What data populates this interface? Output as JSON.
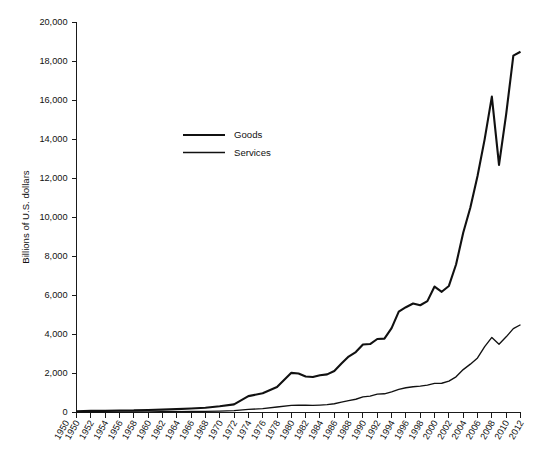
{
  "chart_data": {
    "type": "line",
    "title": "",
    "subtitle": "",
    "xlabel": "",
    "ylabel": "Billions of U.S. dollars",
    "ylim": [
      0,
      20000
    ],
    "xlim": [
      1950,
      2012
    ],
    "grid": false,
    "legend_position": "upper-left-inside",
    "y_ticks": [
      0,
      2000,
      4000,
      6000,
      8000,
      10000,
      12000,
      14000,
      16000,
      18000,
      20000
    ],
    "y_tick_labels": [
      "0",
      "2,000",
      "4,000",
      "6,000",
      "8,000",
      "10,000",
      "12,000",
      "14,000",
      "16,000",
      "18,000",
      "20,000"
    ],
    "x_ticks": [
      1950,
      1952,
      1954,
      1956,
      1958,
      1960,
      1962,
      1964,
      1966,
      1968,
      1970,
      1972,
      1974,
      1976,
      1978,
      1980,
      1982,
      1984,
      1986,
      1988,
      1990,
      1992,
      1994,
      1996,
      1998,
      2000,
      2002,
      2004,
      2006,
      2008,
      2010,
      2012
    ],
    "x_tick_labels": [
      "1950",
      "1950",
      "1952",
      "1954",
      "1956",
      "1958",
      "1960",
      "1962",
      "1964",
      "1966",
      "1968",
      "1970",
      "1972",
      "1974",
      "1976",
      "1978",
      "1980",
      "1982",
      "1984",
      "1986",
      "1988",
      "1990",
      "1992",
      "1994",
      "1996",
      "1998",
      "2000",
      "2002",
      "2004",
      "2006",
      "2008",
      "2010",
      "2012"
    ],
    "x_tick_label_rotation": -60,
    "series": [
      {
        "name": "Goods",
        "color": "#111111",
        "line_width": 2.1,
        "x": [
          1950,
          1952,
          1954,
          1956,
          1958,
          1960,
          1962,
          1964,
          1966,
          1968,
          1970,
          1972,
          1974,
          1976,
          1978,
          1980,
          1981,
          1982,
          1983,
          1984,
          1985,
          1986,
          1987,
          1988,
          1989,
          1990,
          1991,
          1992,
          1993,
          1994,
          1995,
          1996,
          1997,
          1998,
          1999,
          2000,
          2001,
          2002,
          2003,
          2004,
          2005,
          2006,
          2007,
          2008,
          2009,
          2010,
          2011,
          2012
        ],
        "values": [
          62,
          82,
          85,
          105,
          108,
          130,
          145,
          175,
          205,
          240,
          317,
          417,
          839,
          990,
          1305,
          2034,
          2001,
          1846,
          1818,
          1910,
          1954,
          2130,
          2510,
          2870,
          3100,
          3490,
          3510,
          3770,
          3790,
          4330,
          5170,
          5400,
          5590,
          5500,
          5710,
          6460,
          6190,
          6490,
          7590,
          9220,
          10510,
          12130,
          14020,
          16200,
          12700,
          15300,
          18300,
          18500
        ]
      },
      {
        "name": "Services",
        "color": "#111111",
        "line_width": 1.35,
        "x": [
          1950,
          1952,
          1954,
          1956,
          1958,
          1960,
          1962,
          1964,
          1966,
          1968,
          1970,
          1972,
          1974,
          1976,
          1978,
          1980,
          1981,
          1982,
          1983,
          1984,
          1985,
          1986,
          1987,
          1988,
          1989,
          1990,
          1991,
          1992,
          1993,
          1994,
          1995,
          1996,
          1997,
          1998,
          1999,
          2000,
          2001,
          2002,
          2003,
          2004,
          2005,
          2006,
          2007,
          2008,
          2009,
          2010,
          2011,
          2012
        ],
        "values": [
          18,
          22,
          24,
          28,
          30,
          34,
          38,
          44,
          52,
          60,
          74,
          94,
          160,
          200,
          280,
          365,
          375,
          370,
          365,
          380,
          400,
          450,
          530,
          610,
          680,
          800,
          840,
          940,
          960,
          1060,
          1190,
          1270,
          1320,
          1350,
          1400,
          1490,
          1500,
          1610,
          1830,
          2200,
          2480,
          2800,
          3380,
          3850,
          3500,
          3880,
          4300,
          4500
        ]
      }
    ],
    "legend_entries": [
      "Goods",
      "Services"
    ],
    "annotations": []
  }
}
